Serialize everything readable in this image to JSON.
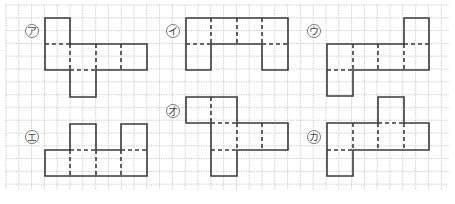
{
  "figure": {
    "grid": {
      "x0": 6,
      "y0": 5,
      "x1": 449,
      "y1": 190,
      "cell": 12.8,
      "line_color": "#b8b8b8"
    },
    "stroke_color": "#3a3a3a",
    "nets": [
      {
        "id": "a",
        "label": "ア",
        "label_pos": [
          32,
          31
        ],
        "faces": [
          [
            45,
            18,
            70,
            44
          ],
          [
            45,
            44,
            70,
            70
          ],
          [
            70,
            44,
            96,
            70
          ],
          [
            96,
            44,
            121,
            70
          ],
          [
            121,
            44,
            147,
            70
          ],
          [
            70,
            70,
            96,
            97
          ]
        ],
        "outline": [
          [
            45,
            18
          ],
          [
            70,
            18
          ],
          [
            70,
            44
          ],
          [
            147,
            44
          ],
          [
            147,
            70
          ],
          [
            96,
            70
          ],
          [
            96,
            97
          ],
          [
            70,
            97
          ],
          [
            70,
            70
          ],
          [
            45,
            70
          ]
        ],
        "folds": [
          [
            45,
            44,
            70,
            44
          ],
          [
            70,
            44,
            70,
            70
          ],
          [
            96,
            44,
            96,
            70
          ],
          [
            121,
            44,
            121,
            70
          ],
          [
            70,
            70,
            96,
            70
          ]
        ]
      },
      {
        "id": "i",
        "label": "イ",
        "label_pos": [
          173,
          31
        ],
        "faces": [
          [
            186,
            18,
            211,
            44
          ],
          [
            211,
            18,
            237,
            44
          ],
          [
            237,
            18,
            262,
            44
          ],
          [
            262,
            18,
            288,
            44
          ],
          [
            186,
            44,
            211,
            70
          ],
          [
            262,
            44,
            288,
            70
          ]
        ],
        "outline": [
          [
            186,
            18
          ],
          [
            288,
            18
          ],
          [
            288,
            70
          ],
          [
            262,
            70
          ],
          [
            262,
            44
          ],
          [
            211,
            44
          ],
          [
            211,
            70
          ],
          [
            186,
            70
          ]
        ],
        "folds": [
          [
            211,
            18,
            211,
            44
          ],
          [
            237,
            18,
            237,
            44
          ],
          [
            262,
            18,
            262,
            44
          ],
          [
            186,
            44,
            211,
            44
          ],
          [
            262,
            44,
            288,
            44
          ]
        ]
      },
      {
        "id": "u",
        "label": "ウ",
        "label_pos": [
          314,
          31
        ],
        "faces": [
          [
            404,
            18,
            429,
            44
          ],
          [
            327,
            44,
            353,
            70
          ],
          [
            353,
            44,
            378,
            70
          ],
          [
            378,
            44,
            404,
            70
          ],
          [
            404,
            44,
            429,
            70
          ],
          [
            327,
            70,
            353,
            96
          ]
        ],
        "outline": [
          [
            404,
            18
          ],
          [
            429,
            18
          ],
          [
            429,
            70
          ],
          [
            353,
            70
          ],
          [
            353,
            96
          ],
          [
            327,
            96
          ],
          [
            327,
            44
          ],
          [
            404,
            44
          ]
        ],
        "folds": [
          [
            404,
            44,
            429,
            44
          ],
          [
            353,
            44,
            353,
            70
          ],
          [
            378,
            44,
            378,
            70
          ],
          [
            404,
            44,
            404,
            70
          ],
          [
            327,
            70,
            353,
            70
          ]
        ]
      },
      {
        "id": "e",
        "label": "エ",
        "label_pos": [
          32,
          137
        ],
        "faces": [
          [
            70,
            124,
            96,
            150
          ],
          [
            121,
            124,
            147,
            150
          ],
          [
            45,
            150,
            70,
            176
          ],
          [
            70,
            150,
            96,
            176
          ],
          [
            96,
            150,
            121,
            176
          ],
          [
            121,
            150,
            147,
            176
          ]
        ],
        "outline": [
          [
            70,
            124
          ],
          [
            96,
            124
          ],
          [
            96,
            150
          ],
          [
            121,
            150
          ],
          [
            121,
            124
          ],
          [
            147,
            124
          ],
          [
            147,
            176
          ],
          [
            45,
            176
          ],
          [
            45,
            150
          ],
          [
            70,
            150
          ]
        ],
        "folds": [
          [
            70,
            150,
            96,
            150
          ],
          [
            121,
            150,
            147,
            150
          ],
          [
            70,
            150,
            70,
            176
          ],
          [
            96,
            150,
            96,
            176
          ],
          [
            121,
            150,
            121,
            176
          ]
        ]
      },
      {
        "id": "o",
        "label": "オ",
        "label_pos": [
          173,
          111
        ],
        "faces": [
          [
            186,
            97,
            211,
            123
          ],
          [
            211,
            97,
            237,
            123
          ],
          [
            211,
            123,
            237,
            150
          ],
          [
            237,
            123,
            262,
            150
          ],
          [
            262,
            123,
            288,
            150
          ],
          [
            211,
            150,
            237,
            176
          ]
        ],
        "outline": [
          [
            186,
            97
          ],
          [
            237,
            97
          ],
          [
            237,
            123
          ],
          [
            288,
            123
          ],
          [
            288,
            150
          ],
          [
            237,
            150
          ],
          [
            237,
            176
          ],
          [
            211,
            176
          ],
          [
            211,
            123
          ],
          [
            186,
            123
          ]
        ],
        "folds": [
          [
            211,
            97,
            211,
            123
          ],
          [
            211,
            123,
            237,
            123
          ],
          [
            237,
            123,
            237,
            150
          ],
          [
            262,
            123,
            262,
            150
          ],
          [
            211,
            150,
            237,
            150
          ]
        ]
      },
      {
        "id": "ka",
        "label": "カ",
        "label_pos": [
          314,
          137
        ],
        "faces": [
          [
            378,
            97,
            404,
            123
          ],
          [
            327,
            123,
            353,
            150
          ],
          [
            353,
            123,
            378,
            150
          ],
          [
            378,
            123,
            404,
            150
          ],
          [
            404,
            123,
            429,
            150
          ],
          [
            327,
            150,
            353,
            176
          ]
        ],
        "outline": [
          [
            378,
            97
          ],
          [
            404,
            97
          ],
          [
            404,
            123
          ],
          [
            429,
            123
          ],
          [
            429,
            150
          ],
          [
            353,
            150
          ],
          [
            353,
            176
          ],
          [
            327,
            176
          ],
          [
            327,
            123
          ],
          [
            378,
            123
          ]
        ],
        "folds": [
          [
            378,
            123,
            404,
            123
          ],
          [
            353,
            123,
            353,
            150
          ],
          [
            378,
            123,
            378,
            150
          ],
          [
            404,
            123,
            404,
            150
          ],
          [
            327,
            150,
            353,
            150
          ]
        ]
      }
    ]
  }
}
